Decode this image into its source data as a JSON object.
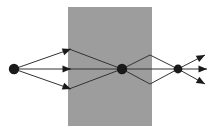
{
  "figure": {
    "type": "optics-ray-diagram",
    "title": "",
    "width": 215,
    "height": 135,
    "background_color": "#ffffff"
  },
  "colors": {
    "background": "#ffffff",
    "medium_fill": "#9d9d9d",
    "ray_stroke": "#333333",
    "point_fill": "#1a1a1a",
    "arrow_fill": "#1a1a1a"
  },
  "medium": {
    "label": "optical-medium-slab",
    "x": 68,
    "y": 7,
    "width": 84,
    "height": 119,
    "fill": "#9d9d9d"
  },
  "points": [
    {
      "name": "source-point",
      "x": 14,
      "y": 69,
      "r": 5.2
    },
    {
      "name": "focus-point",
      "x": 122,
      "y": 69,
      "r": 5.2
    },
    {
      "name": "second-focus-point",
      "x": 178,
      "y": 69,
      "r": 4.4
    }
  ],
  "rays": {
    "incident": [
      {
        "name": "incident-ray-upper",
        "x1": 14,
        "y1": 69,
        "x2": 71,
        "y2": 49,
        "arrow": true
      },
      {
        "name": "incident-ray-middle",
        "x1": 14,
        "y1": 69,
        "x2": 71,
        "y2": 69,
        "arrow": true
      },
      {
        "name": "incident-ray-lower",
        "x1": 14,
        "y1": 69,
        "x2": 71,
        "y2": 89,
        "arrow": true
      }
    ],
    "internal": [
      {
        "name": "internal-ray-upper",
        "x1": 69,
        "y1": 49,
        "x2": 122,
        "y2": 69,
        "arrow": false
      },
      {
        "name": "internal-ray-middle",
        "x1": 69,
        "y1": 69,
        "x2": 122,
        "y2": 69,
        "arrow": false
      },
      {
        "name": "internal-ray-lower",
        "x1": 69,
        "y1": 89,
        "x2": 122,
        "y2": 69,
        "arrow": false
      }
    ],
    "diverging": [
      {
        "name": "diverging-ray-upper",
        "x1": 122,
        "y1": 69,
        "x2": 178,
        "y2": 69,
        "via_x": 150,
        "via_y": 55,
        "arrow": false
      },
      {
        "name": "diverging-ray-middle",
        "x1": 122,
        "y1": 69,
        "x2": 178,
        "y2": 69,
        "via_x": 150,
        "via_y": 69,
        "arrow": false
      },
      {
        "name": "diverging-ray-lower",
        "x1": 122,
        "y1": 69,
        "x2": 178,
        "y2": 69,
        "via_x": 150,
        "via_y": 84,
        "arrow": false
      }
    ],
    "emergent": [
      {
        "name": "emergent-ray-upper",
        "x1": 178,
        "y1": 69,
        "x2": 205,
        "y2": 55,
        "arrow": true
      },
      {
        "name": "emergent-ray-middle",
        "x1": 178,
        "y1": 69,
        "x2": 207,
        "y2": 69,
        "arrow": true
      },
      {
        "name": "emergent-ray-lower",
        "x1": 178,
        "y1": 69,
        "x2": 205,
        "y2": 84,
        "arrow": true
      }
    ]
  },
  "annotations": {
    "caption": "",
    "labels": []
  },
  "chart_data": {
    "type": "scatter",
    "title": "",
    "xlabel": "",
    "ylabel": "",
    "grid": false,
    "legend": "none",
    "xlim": [
      0,
      215
    ],
    "ylim": [
      0,
      135
    ],
    "series": [
      {
        "name": "nodes",
        "values": [
          {
            "label": "source",
            "x": 14,
            "y": 69
          },
          {
            "label": "focus",
            "x": 122,
            "y": 69
          },
          {
            "label": "second-focus",
            "x": 178,
            "y": 69
          }
        ]
      },
      {
        "name": "ray-endpoints",
        "values": [
          {
            "label": "entry-upper",
            "x": 71,
            "y": 49
          },
          {
            "label": "entry-middle",
            "x": 71,
            "y": 69
          },
          {
            "label": "entry-lower",
            "x": 71,
            "y": 89
          },
          {
            "label": "exit-upper",
            "x": 205,
            "y": 55
          },
          {
            "label": "exit-middle",
            "x": 207,
            "y": 69
          },
          {
            "label": "exit-lower",
            "x": 205,
            "y": 84
          }
        ]
      }
    ]
  }
}
